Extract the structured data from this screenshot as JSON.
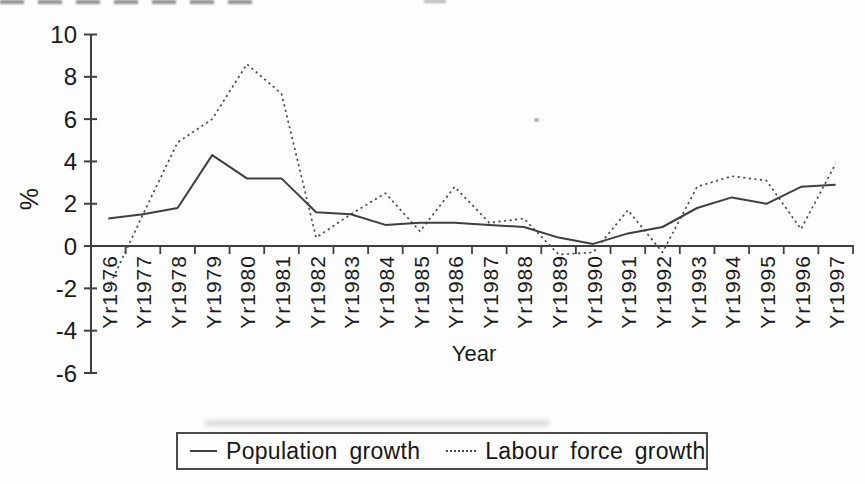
{
  "figure": {
    "background": "#fdfdfd",
    "ink_color": "#3f3f3f",
    "text_color": "#1a1a1a"
  },
  "chart_data": {
    "type": "line",
    "title": "",
    "xlabel": "Year",
    "ylabel": "%",
    "ylim": [
      -6,
      10
    ],
    "yticks": [
      10,
      8,
      6,
      4,
      2,
      0,
      -2,
      -4,
      -6
    ],
    "grid": false,
    "legend_position": "bottom",
    "categories": [
      "Yr1976",
      "Yr1977",
      "Yr1978",
      "Yr1979",
      "Yr1980",
      "Yr1981",
      "Yr1982",
      "Yr1983",
      "Yr1984",
      "Yr1985",
      "Yr1986",
      "Yr1987",
      "Yr1988",
      "Yr1989",
      "Yr1990",
      "Yr1991",
      "Yr1992",
      "Yr1993",
      "Yr1994",
      "Yr1995",
      "Yr1996",
      "Yr1997"
    ],
    "series": [
      {
        "name": "Population growth",
        "line_style": "solid",
        "values": [
          1.3,
          1.5,
          1.8,
          4.3,
          3.2,
          3.2,
          1.6,
          1.5,
          1.0,
          1.1,
          1.1,
          1.0,
          0.9,
          0.4,
          0.1,
          0.6,
          0.9,
          1.8,
          2.3,
          2.0,
          2.8,
          2.9
        ]
      },
      {
        "name": "Labour force growth",
        "line_style": "dotted",
        "values": [
          -2.0,
          1.5,
          4.9,
          6.0,
          8.6,
          7.2,
          0.4,
          1.5,
          2.5,
          0.7,
          2.8,
          1.1,
          1.3,
          -0.4,
          -0.3,
          1.7,
          -0.3,
          2.8,
          3.3,
          3.1,
          0.8,
          3.9
        ]
      }
    ]
  }
}
